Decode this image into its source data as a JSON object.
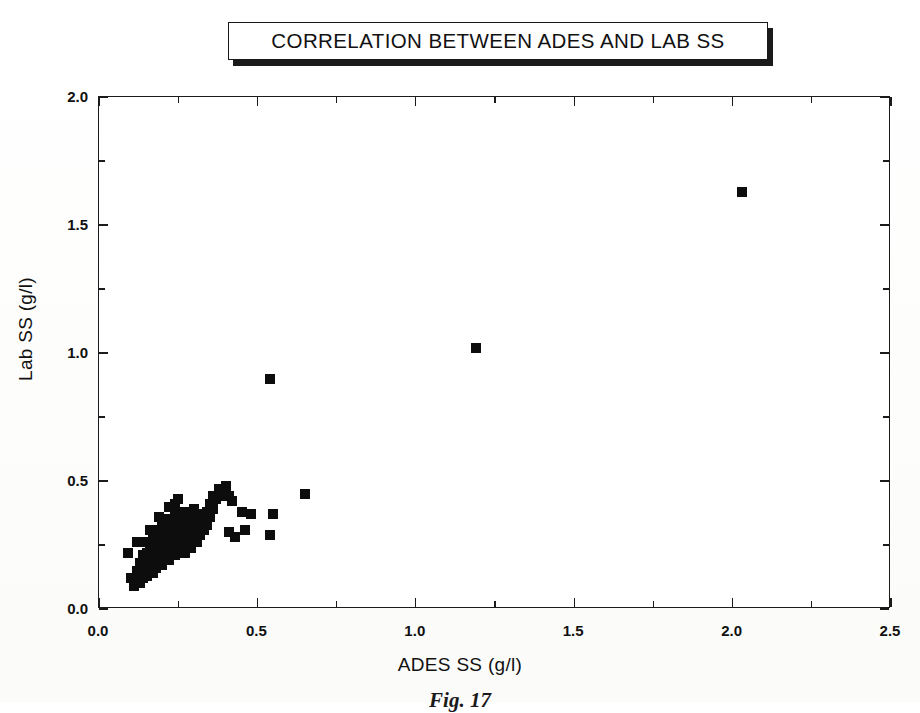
{
  "figure": {
    "title": "CORRELATION BETWEEN ADES AND LAB SS",
    "caption": "Fig. 17"
  },
  "axes": {
    "x_title": "ADES SS (g/l)",
    "y_title": "Lab SS (g/l)",
    "x_ticklabels": [
      "0.0",
      "0.5",
      "1.0",
      "1.5",
      "2.0",
      "2.5"
    ],
    "y_ticklabels": [
      "0.0",
      "0.5",
      "1.0",
      "1.5",
      "2.0"
    ]
  },
  "chart_data": {
    "type": "scatter",
    "title": "CORRELATION BETWEEN ADES AND LAB SS",
    "xlabel": "ADES SS (g/l)",
    "ylabel": "Lab SS (g/l)",
    "xlim": [
      0.0,
      2.5
    ],
    "ylim": [
      0.0,
      2.0
    ],
    "xticks": [
      0.0,
      0.5,
      1.0,
      1.5,
      2.0,
      2.5
    ],
    "yticks": [
      0.0,
      0.5,
      1.0,
      1.5,
      2.0
    ],
    "x_minor_ticks": [
      0.25,
      0.75,
      1.25,
      1.75,
      2.25
    ],
    "y_minor_ticks": [
      0.25,
      0.75,
      1.25,
      1.75
    ],
    "grid": false,
    "legend": null,
    "marker": "square",
    "marker_color": "#0d0d0d",
    "marker_size_px": 10,
    "series": [
      {
        "name": "ADES vs Lab SS",
        "points": [
          [
            0.09,
            0.22
          ],
          [
            0.1,
            0.12
          ],
          [
            0.11,
            0.09
          ],
          [
            0.12,
            0.11
          ],
          [
            0.12,
            0.15
          ],
          [
            0.13,
            0.1
          ],
          [
            0.13,
            0.14
          ],
          [
            0.13,
            0.18
          ],
          [
            0.14,
            0.12
          ],
          [
            0.14,
            0.16
          ],
          [
            0.14,
            0.21
          ],
          [
            0.15,
            0.13
          ],
          [
            0.15,
            0.17
          ],
          [
            0.15,
            0.22
          ],
          [
            0.15,
            0.26
          ],
          [
            0.16,
            0.15
          ],
          [
            0.16,
            0.19
          ],
          [
            0.16,
            0.23
          ],
          [
            0.17,
            0.14
          ],
          [
            0.17,
            0.18
          ],
          [
            0.17,
            0.22
          ],
          [
            0.17,
            0.27
          ],
          [
            0.18,
            0.16
          ],
          [
            0.18,
            0.2
          ],
          [
            0.18,
            0.24
          ],
          [
            0.18,
            0.29
          ],
          [
            0.19,
            0.18
          ],
          [
            0.19,
            0.22
          ],
          [
            0.19,
            0.26
          ],
          [
            0.19,
            0.31
          ],
          [
            0.2,
            0.17
          ],
          [
            0.2,
            0.21
          ],
          [
            0.2,
            0.25
          ],
          [
            0.2,
            0.29
          ],
          [
            0.2,
            0.33
          ],
          [
            0.21,
            0.2
          ],
          [
            0.21,
            0.24
          ],
          [
            0.21,
            0.28
          ],
          [
            0.21,
            0.32
          ],
          [
            0.22,
            0.19
          ],
          [
            0.22,
            0.23
          ],
          [
            0.22,
            0.27
          ],
          [
            0.22,
            0.31
          ],
          [
            0.22,
            0.35
          ],
          [
            0.23,
            0.22
          ],
          [
            0.23,
            0.26
          ],
          [
            0.23,
            0.3
          ],
          [
            0.23,
            0.34
          ],
          [
            0.24,
            0.21
          ],
          [
            0.24,
            0.25
          ],
          [
            0.24,
            0.29
          ],
          [
            0.24,
            0.33
          ],
          [
            0.24,
            0.37
          ],
          [
            0.25,
            0.23
          ],
          [
            0.25,
            0.27
          ],
          [
            0.25,
            0.31
          ],
          [
            0.25,
            0.35
          ],
          [
            0.25,
            0.43
          ],
          [
            0.26,
            0.24
          ],
          [
            0.26,
            0.28
          ],
          [
            0.26,
            0.32
          ],
          [
            0.26,
            0.36
          ],
          [
            0.27,
            0.22
          ],
          [
            0.27,
            0.26
          ],
          [
            0.27,
            0.3
          ],
          [
            0.27,
            0.34
          ],
          [
            0.27,
            0.38
          ],
          [
            0.28,
            0.25
          ],
          [
            0.28,
            0.29
          ],
          [
            0.28,
            0.33
          ],
          [
            0.28,
            0.37
          ],
          [
            0.29,
            0.24
          ],
          [
            0.29,
            0.28
          ],
          [
            0.29,
            0.32
          ],
          [
            0.29,
            0.36
          ],
          [
            0.3,
            0.27
          ],
          [
            0.3,
            0.31
          ],
          [
            0.3,
            0.35
          ],
          [
            0.3,
            0.39
          ],
          [
            0.31,
            0.26
          ],
          [
            0.31,
            0.3
          ],
          [
            0.31,
            0.34
          ],
          [
            0.32,
            0.29
          ],
          [
            0.32,
            0.33
          ],
          [
            0.32,
            0.37
          ],
          [
            0.33,
            0.31
          ],
          [
            0.33,
            0.35
          ],
          [
            0.34,
            0.33
          ],
          [
            0.34,
            0.38
          ],
          [
            0.35,
            0.36
          ],
          [
            0.35,
            0.41
          ],
          [
            0.36,
            0.39
          ],
          [
            0.36,
            0.44
          ],
          [
            0.37,
            0.43
          ],
          [
            0.38,
            0.45
          ],
          [
            0.38,
            0.47
          ],
          [
            0.39,
            0.44
          ],
          [
            0.39,
            0.46
          ],
          [
            0.4,
            0.45
          ],
          [
            0.4,
            0.48
          ],
          [
            0.41,
            0.44
          ],
          [
            0.42,
            0.42
          ],
          [
            0.12,
            0.26
          ],
          [
            0.16,
            0.31
          ],
          [
            0.19,
            0.36
          ],
          [
            0.22,
            0.4
          ],
          [
            0.24,
            0.41
          ],
          [
            0.41,
            0.3
          ],
          [
            0.43,
            0.28
          ],
          [
            0.45,
            0.38
          ],
          [
            0.46,
            0.31
          ],
          [
            0.48,
            0.37
          ],
          [
            0.54,
            0.29
          ],
          [
            0.55,
            0.37
          ],
          [
            0.65,
            0.45
          ],
          [
            0.54,
            0.9
          ],
          [
            1.19,
            1.02
          ],
          [
            2.03,
            1.63
          ]
        ]
      }
    ]
  }
}
